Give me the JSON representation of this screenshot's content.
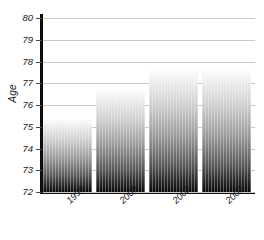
{
  "chart_data": {
    "type": "bar",
    "title": "",
    "xlabel": "",
    "ylabel": "Age",
    "categories": [
      "1990",
      "2000",
      "2002",
      "2003"
    ],
    "values": [
      75.4,
      76.8,
      77.7,
      77.7
    ],
    "ylim": [
      72,
      80
    ],
    "ytick_labels": [
      "80",
      "79",
      "78",
      "77",
      "76",
      "75",
      "74",
      "73",
      "72"
    ],
    "ytick_values": [
      80,
      79,
      78,
      77,
      76,
      75,
      74,
      73,
      72
    ],
    "grid": true,
    "legend": null,
    "bar_style": {
      "gradient_top": "#ffffff",
      "gradient_bottom": "#0a0a0a",
      "axis_color": "#0d0d0d",
      "gridline_color": "#c9c9c9"
    }
  }
}
